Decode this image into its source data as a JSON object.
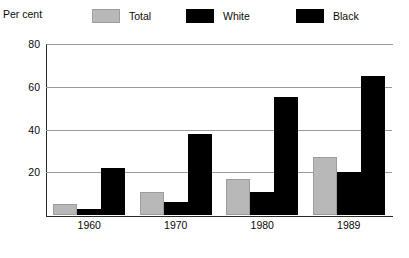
{
  "axis_title": "Per cent",
  "legend": {
    "items": [
      {
        "label": "Total",
        "color": "#b8b8b8",
        "icon": "legend-swatch-total"
      },
      {
        "label": "White",
        "color": "#000000",
        "icon": "legend-swatch-white"
      },
      {
        "label": "Black",
        "color": "#000000",
        "icon": "legend-swatch-black"
      }
    ]
  },
  "yticks": [
    {
      "label": "80",
      "value": 80
    },
    {
      "label": "60",
      "value": 60
    },
    {
      "label": "40",
      "value": 40
    },
    {
      "label": "20",
      "value": 20
    }
  ],
  "xticks": [
    {
      "label": "1960"
    },
    {
      "label": "1970"
    },
    {
      "label": "1980"
    },
    {
      "label": "1989"
    }
  ],
  "chart_data": {
    "type": "bar",
    "title": "",
    "subtitle": "",
    "xlabel": "",
    "ylabel": "Per cent",
    "ylim": [
      0,
      80
    ],
    "yticks": [
      0,
      20,
      40,
      60,
      80
    ],
    "grid": true,
    "legend_position": "top",
    "categories": [
      "1960",
      "1970",
      "1980",
      "1989"
    ],
    "series": [
      {
        "name": "Total",
        "color": "#b8b8b8",
        "values": [
          5,
          11,
          17,
          27
        ]
      },
      {
        "name": "White",
        "color": "#000000",
        "values": [
          3,
          6,
          11,
          20
        ]
      },
      {
        "name": "Black",
        "color": "#000000",
        "values": [
          22,
          38,
          55,
          65
        ]
      }
    ]
  }
}
